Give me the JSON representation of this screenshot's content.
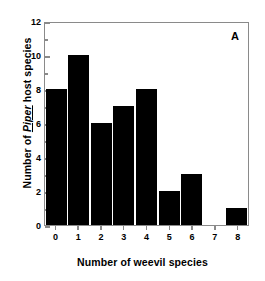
{
  "chart_data": {
    "type": "bar",
    "title": "",
    "panel_label": "A",
    "categories": [
      "0",
      "1",
      "2",
      "3",
      "4",
      "5",
      "6",
      "7",
      "8"
    ],
    "values": [
      8,
      10,
      6,
      7,
      8,
      2,
      3,
      0,
      1
    ],
    "series": [
      {
        "name": "Piper host species count",
        "values": [
          8,
          10,
          6,
          7,
          8,
          2,
          3,
          0,
          1
        ]
      }
    ],
    "xlabel": "Number of weevil species",
    "ylabel_parts": {
      "prefix": "Number of ",
      "italic": "Piper",
      "suffix": " host species"
    },
    "ylabel": "Number of Piper host species",
    "ylim": [
      0,
      12
    ],
    "xlim_categories": [
      "0",
      "8"
    ],
    "ytick_labels": [
      "0",
      "2",
      "4",
      "6",
      "8",
      "10",
      "12"
    ],
    "ytick_values": [
      0,
      2,
      4,
      6,
      8,
      10,
      12
    ],
    "yminor_tick_values": [
      1,
      3,
      5,
      7,
      9,
      11
    ],
    "grid": false,
    "legend": null,
    "bar_color": "#000000",
    "frame_color": "#8a8a8a",
    "background_color": "#ffffff"
  }
}
